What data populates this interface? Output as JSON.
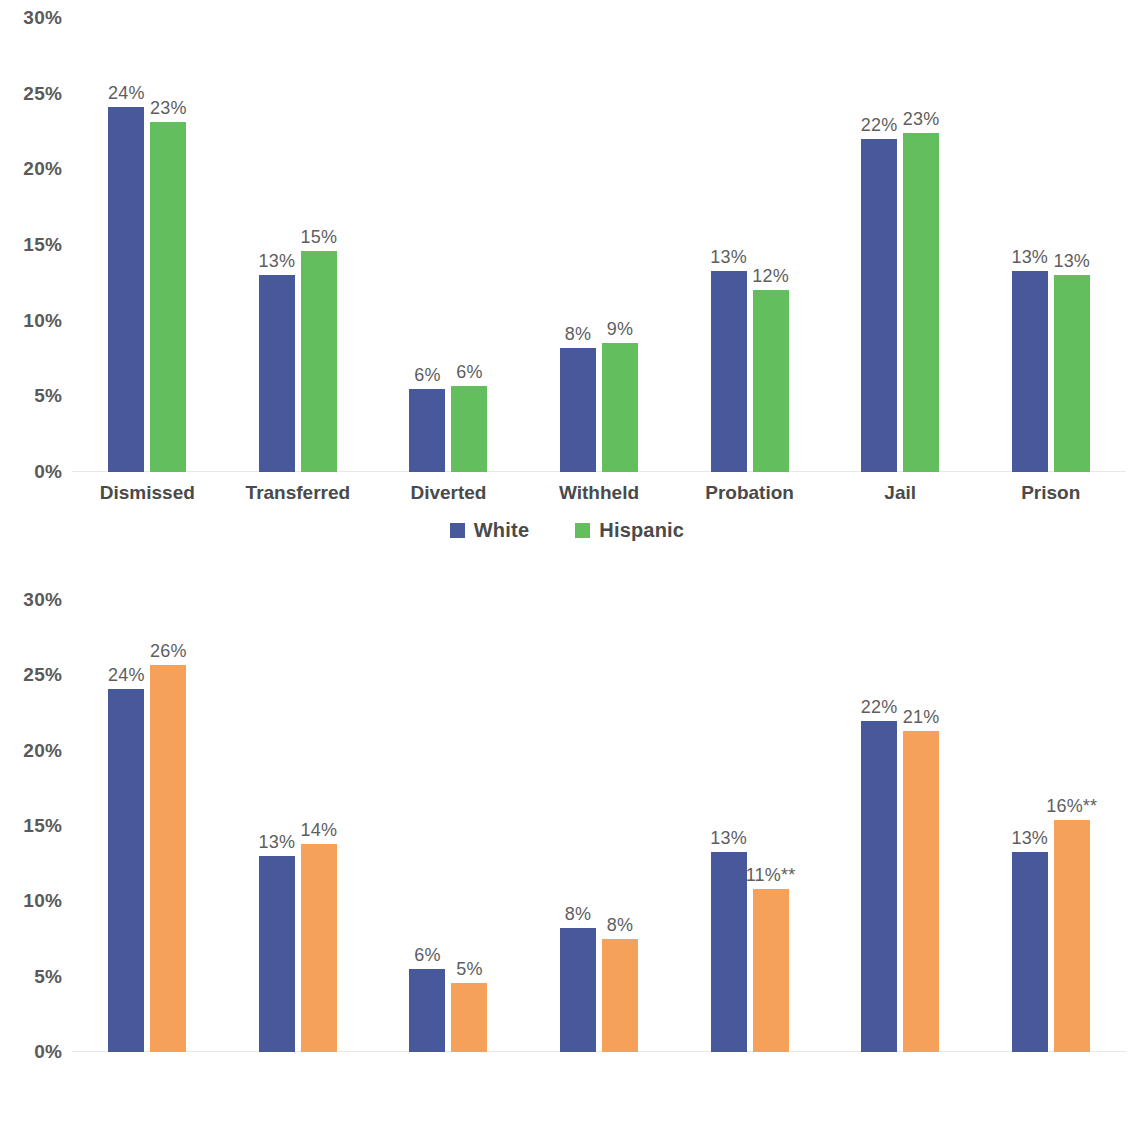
{
  "colors": {
    "white_series": "#48599B",
    "hispanic_series": "#63BE5E",
    "black_series": "#F5A159",
    "axis_text": "#5a5a5a",
    "label_text": "#5e5e5e",
    "gridline": "#f3f3f3",
    "background": "#ffffff"
  },
  "chart_data": [
    {
      "type": "bar",
      "title": "",
      "xlabel": "",
      "ylabel": "",
      "ylim": [
        0,
        30
      ],
      "yticks": [
        0,
        5,
        10,
        15,
        20,
        25,
        30
      ],
      "ytick_labels": [
        "0%",
        "5%",
        "10%",
        "15%",
        "20%",
        "25%",
        "30%"
      ],
      "grid": false,
      "legend_position": "bottom",
      "categories": [
        "Dismissed",
        "Transferred",
        "Diverted",
        "Withheld",
        "Probation",
        "Jail",
        "Prison"
      ],
      "series": [
        {
          "name": "White",
          "color": "#48599B",
          "values": [
            24.1,
            13.0,
            5.5,
            8.2,
            13.3,
            22.0,
            13.3
          ],
          "labels": [
            "24%",
            "13%",
            "6%",
            "8%",
            "13%",
            "22%",
            "13%"
          ]
        },
        {
          "name": "Hispanic",
          "color": "#63BE5E",
          "values": [
            23.1,
            14.6,
            5.7,
            8.5,
            12.0,
            22.4,
            13.0
          ],
          "labels": [
            "23%",
            "15%",
            "6%",
            "9%",
            "12%",
            "23%",
            "13%"
          ]
        }
      ]
    },
    {
      "type": "bar",
      "title": "",
      "xlabel": "",
      "ylabel": "",
      "ylim": [
        0,
        30
      ],
      "yticks": [
        0,
        5,
        10,
        15,
        20,
        25,
        30
      ],
      "ytick_labels": [
        "0%",
        "5%",
        "10%",
        "15%",
        "20%",
        "25%",
        "30%"
      ],
      "grid": false,
      "legend_position": "bottom",
      "categories": [
        "Dismissed",
        "Transferred",
        "Diverted",
        "Withheld",
        "Probation",
        "Jail",
        "Prison"
      ],
      "series": [
        {
          "name": "White",
          "color": "#48599B",
          "values": [
            24.1,
            13.0,
            5.5,
            8.2,
            13.3,
            22.0,
            13.3
          ],
          "labels": [
            "24%",
            "13%",
            "6%",
            "8%",
            "13%",
            "22%",
            "13%"
          ]
        },
        {
          "name": "Black",
          "color": "#F5A159",
          "values": [
            25.7,
            13.8,
            4.6,
            7.5,
            10.8,
            21.3,
            15.4
          ],
          "labels": [
            "26%",
            "14%",
            "5%",
            "8%",
            "11%**",
            "21%",
            "16%**"
          ]
        }
      ]
    }
  ]
}
